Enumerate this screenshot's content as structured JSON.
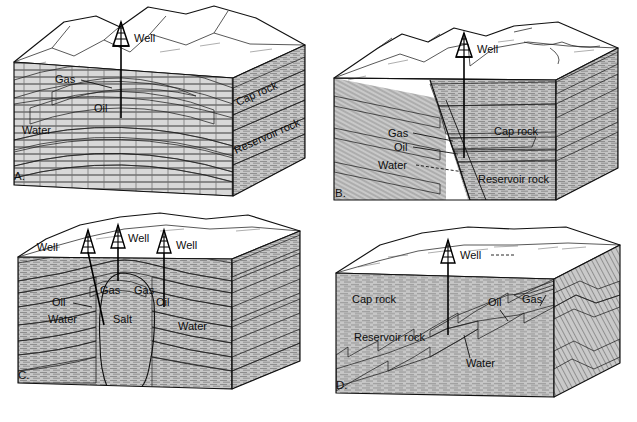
{
  "figure": {
    "background_color": "#ffffff"
  },
  "palette": {
    "outline": "#111111",
    "gas": "#d7d7d7",
    "oil": "#6f6f6f",
    "water": "#9a9a9a",
    "cap_rock": "#cfcfcf",
    "reservoir_rock": "#bdbdbd",
    "salt": "#f0efe9",
    "surface": "#fdfdfb",
    "shale": "#c6c6c6"
  },
  "panels": [
    {
      "id": "A",
      "letter": "A.",
      "trap_type": "anticline",
      "labels": [
        {
          "name": "well",
          "text": "Well"
        },
        {
          "name": "gas",
          "text": "Gas"
        },
        {
          "name": "oil",
          "text": "Oil"
        },
        {
          "name": "water",
          "text": "Water"
        },
        {
          "name": "cap-rock",
          "text": "Cap rock"
        },
        {
          "name": "reservoir-rock",
          "text": "Reservoir rock"
        }
      ],
      "well_count": 1
    },
    {
      "id": "B",
      "letter": "B.",
      "trap_type": "fault",
      "labels": [
        {
          "name": "well",
          "text": "Well"
        },
        {
          "name": "gas",
          "text": "Gas"
        },
        {
          "name": "oil",
          "text": "Oil"
        },
        {
          "name": "water",
          "text": "Water"
        },
        {
          "name": "cap-rock",
          "text": "Cap rock"
        },
        {
          "name": "reservoir-rock",
          "text": "Reservoir rock"
        }
      ],
      "well_count": 1
    },
    {
      "id": "C",
      "letter": "C.",
      "trap_type": "salt dome",
      "labels": [
        {
          "name": "well-left",
          "text": "Well"
        },
        {
          "name": "well-center",
          "text": "Well"
        },
        {
          "name": "well-right",
          "text": "Well"
        },
        {
          "name": "gas-left",
          "text": "Gas"
        },
        {
          "name": "gas-right",
          "text": "Gas"
        },
        {
          "name": "oil-left",
          "text": "Oil"
        },
        {
          "name": "oil-right",
          "text": "Oil"
        },
        {
          "name": "water-left",
          "text": "Water"
        },
        {
          "name": "water-right",
          "text": "Water"
        },
        {
          "name": "salt",
          "text": "Salt"
        }
      ],
      "well_count": 3
    },
    {
      "id": "D",
      "letter": "D.",
      "trap_type": "stratigraphic pinchout",
      "labels": [
        {
          "name": "well",
          "text": "Well"
        },
        {
          "name": "cap-rock",
          "text": "Cap rock"
        },
        {
          "name": "reservoir-rock",
          "text": "Reservoir rock"
        },
        {
          "name": "oil",
          "text": "Oil"
        },
        {
          "name": "gas",
          "text": "Gas"
        },
        {
          "name": "water",
          "text": "Water"
        }
      ],
      "well_count": 1
    }
  ]
}
